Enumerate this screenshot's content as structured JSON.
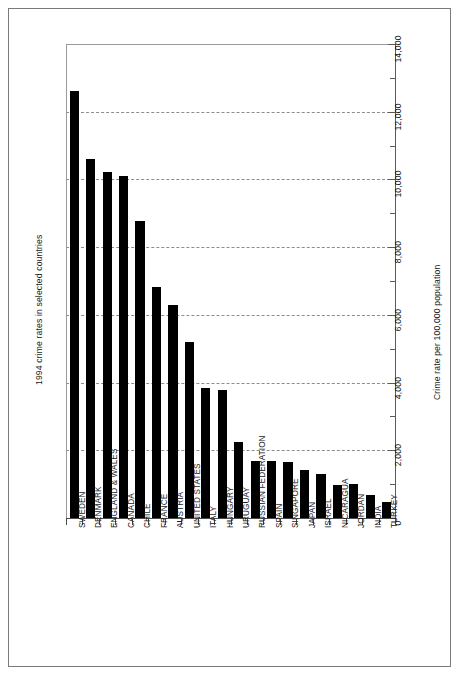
{
  "chart_data": {
    "type": "bar",
    "title": "1994 crime rates in selected countries",
    "xlabel": "",
    "ylabel": "Crime rate per 100,000 population",
    "ylim": [
      0,
      14000
    ],
    "ytick_step": 2000,
    "yminor_step": 1000,
    "grid": true,
    "grid_axis": "y",
    "legend": false,
    "orientation": "vertical",
    "bar_color": "#000000",
    "categories": [
      "SWEDEN",
      "DENMARK",
      "ENGLAND & WALES",
      "CANADA",
      "CHILE",
      "FRANCE",
      "AUSTRIA",
      "UNITED STATES",
      "ITALY",
      "HUNGARY",
      "URUGUAY",
      "RUSSIAN FEDERATION",
      "SPAIN",
      "SINGAPORE",
      "JAPAN",
      "ISRAEL",
      "NICARAGUA",
      "JORDAN",
      "INDIA",
      "TURKEY"
    ],
    "values": [
      12620,
      10610,
      10230,
      10100,
      8760,
      6830,
      6300,
      5200,
      3840,
      3790,
      2250,
      1680,
      1670,
      1640,
      1430,
      1300,
      980,
      1000,
      680,
      480
    ],
    "ytick_labels": [
      "0",
      "2,000",
      "4,000",
      "6,000",
      "8,000",
      "10,000",
      "12,000",
      "14,000"
    ],
    "ytick_values": [
      0,
      2000,
      4000,
      6000,
      8000,
      10000,
      12000,
      14000
    ]
  }
}
